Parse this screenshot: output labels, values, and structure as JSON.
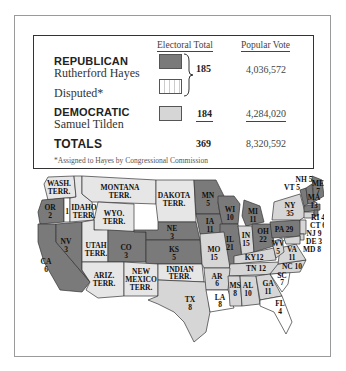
{
  "legend": {
    "headers": {
      "electoral": "Electoral Total",
      "popular": "Popular Vote"
    },
    "republican": {
      "party": "REPUBLICAN",
      "candidate": "Rutherford Hayes",
      "popular": "4,036,572"
    },
    "disputed": {
      "label": "Disputed*"
    },
    "combined_electoral": "185",
    "democratic": {
      "party": "DEMOCRATIC",
      "candidate": "Samuel Tilden",
      "electoral": "184",
      "popular": "4,284,020"
    },
    "totals": {
      "label": "TOTALS",
      "electoral": "369",
      "popular": "8,320,592"
    },
    "footnote": "*Assigned to Hayes by Congressional Commission"
  },
  "colors": {
    "republican": "#7a7a7a",
    "democratic": "#d6d6d6",
    "territory": "#e6e6e6",
    "disputed": "#ffffff"
  },
  "map": {
    "labels": {
      "wash": [
        "WASH.",
        "TERR."
      ],
      "or": [
        "OR",
        "2"
      ],
      "or_disputed": "1",
      "idaho": [
        "IDAHO",
        "TERR."
      ],
      "montana": [
        "MONTANA",
        "TERR."
      ],
      "wyo": [
        "WYO.",
        "TERR."
      ],
      "dakota": [
        "DAKOTA",
        "TERR."
      ],
      "ca": [
        "CA",
        "6"
      ],
      "nv": [
        "NV",
        "3"
      ],
      "utah": [
        "UTAH",
        "TERR."
      ],
      "co": [
        "CO",
        "3"
      ],
      "ne": [
        "NE",
        "3"
      ],
      "ks": [
        "KS",
        "5"
      ],
      "ariz": [
        "ARIZ.",
        "TERR."
      ],
      "nm": [
        "NEW",
        "MEXICO",
        "TERR."
      ],
      "indian": [
        "INDIAN",
        "TERR."
      ],
      "tx": [
        "TX",
        "8"
      ],
      "mn": [
        "MN",
        "5"
      ],
      "ia": [
        "IA",
        "11"
      ],
      "mo": [
        "MO",
        "15"
      ],
      "ar": [
        "AR",
        "6"
      ],
      "la": [
        "LA",
        "8"
      ],
      "wi": [
        "WI",
        "10"
      ],
      "il": [
        "IL",
        "21"
      ],
      "mi": [
        "MI",
        "11"
      ],
      "in": [
        "IN",
        "15"
      ],
      "oh": [
        "OH",
        "22"
      ],
      "ky": "KY12",
      "tn": "TN 12",
      "ms": [
        "MS",
        "8"
      ],
      "al": [
        "AL",
        "10"
      ],
      "ga": [
        "GA",
        "11"
      ],
      "fl": [
        "FL",
        "4"
      ],
      "sc": [
        "SC",
        "7"
      ],
      "nc": "NC 10",
      "va": [
        "VA",
        "11"
      ],
      "wv": [
        "WV",
        "5"
      ],
      "pa": "PA 29",
      "ny": [
        "NY",
        "35"
      ],
      "vt": "VT 5",
      "nh": "NH 5",
      "me": [
        "ME",
        "7"
      ],
      "ma": [
        "MA",
        "13"
      ],
      "ri": "RI 4",
      "ct": "CT 6",
      "nj": "NJ 9",
      "de": "DE 3",
      "md": "MD 8"
    }
  }
}
